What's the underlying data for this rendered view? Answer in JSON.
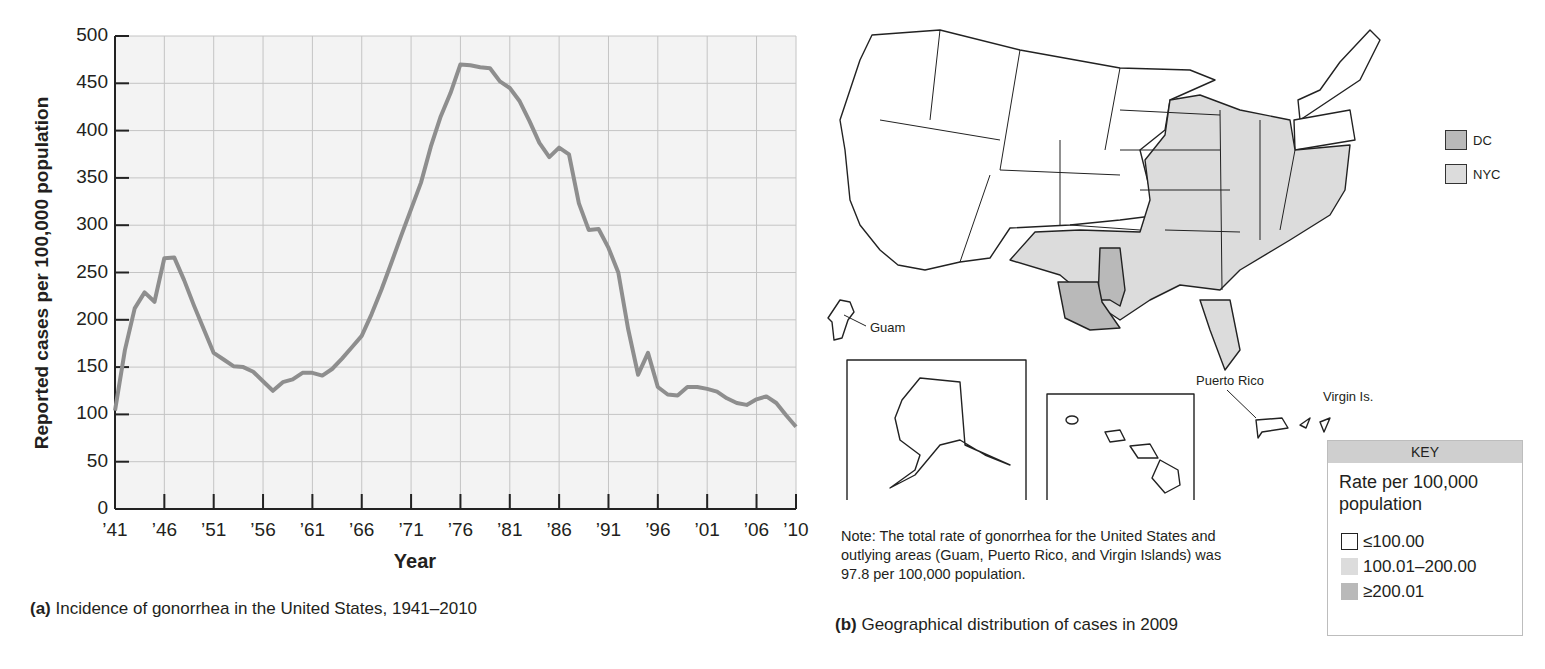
{
  "panel_a": {
    "ylabel": "Reported cases per 100,000 population",
    "xlabel": "Year",
    "caption_label": "(a)",
    "caption_text": " Incidence of gonorrhea in the United States, 1941–2010",
    "yticks": [
      "500",
      "450",
      "400",
      "350",
      "300",
      "250",
      "200",
      "150",
      "100",
      "50",
      "0"
    ],
    "xticks": [
      "’41",
      "’46",
      "’51",
      "’56",
      "’61",
      "’66",
      "’71",
      "’76",
      "’81",
      "’86",
      "’91",
      "’96",
      "’01",
      "’06",
      "’10"
    ]
  },
  "panel_b": {
    "caption_label": "(b)",
    "caption_text": " Geographical distribution of cases in 2009",
    "note": "Note: The total rate of gonorrhea for the United States and outlying areas (Guam, Puerto Rico, and Virgin Islands) was 97.8 per 100,000 population.",
    "labels": {
      "guam": "Guam",
      "puerto_rico": "Puerto Rico",
      "virgin_islands": "Virgin Is."
    },
    "inset_legend": [
      {
        "label": "DC",
        "color": "#b9b9b9"
      },
      {
        "label": "NYC",
        "color": "#dcdcdc"
      }
    ],
    "key": {
      "header": "KEY",
      "title": "Rate per 100,000 population",
      "items": [
        {
          "label": "≤100.00",
          "color": "#ffffff"
        },
        {
          "label": "100.01–200.00",
          "color": "#dcdcdc"
        },
        {
          "label": "≥200.01",
          "color": "#b9b9b9"
        }
      ]
    }
  },
  "colors": {
    "line": "#8e8e8e",
    "grid": "#c4c4c4",
    "plot_bg": "#f3f3f3",
    "state_fill_mid": "#dcdcdc",
    "state_fill_high": "#b9b9b9"
  },
  "chart_data": [
    {
      "type": "line",
      "title": "Incidence of gonorrhea in the United States, 1941–2010",
      "xlabel": "Year",
      "ylabel": "Reported cases per 100,000 population",
      "ylim": [
        0,
        500
      ],
      "xlim": [
        1941,
        2010
      ],
      "grid": true,
      "x": [
        1941,
        1942,
        1943,
        1944,
        1945,
        1946,
        1947,
        1948,
        1949,
        1950,
        1951,
        1952,
        1953,
        1954,
        1955,
        1956,
        1957,
        1958,
        1959,
        1960,
        1961,
        1962,
        1963,
        1964,
        1965,
        1966,
        1967,
        1968,
        1969,
        1970,
        1971,
        1972,
        1973,
        1974,
        1975,
        1976,
        1977,
        1978,
        1979,
        1980,
        1981,
        1982,
        1983,
        1984,
        1985,
        1986,
        1987,
        1988,
        1989,
        1990,
        1991,
        1992,
        1993,
        1994,
        1995,
        1996,
        1997,
        1998,
        1999,
        2000,
        2001,
        2002,
        2003,
        2004,
        2005,
        2006,
        2007,
        2008,
        2009,
        2010
      ],
      "series": [
        {
          "name": "Gonorrhea rate",
          "values": [
            104,
            168,
            212,
            229,
            219,
            265,
            266,
            242,
            215,
            190,
            165,
            158,
            151,
            150,
            145,
            135,
            125,
            134,
            137,
            144,
            144,
            141,
            148,
            159,
            171,
            183,
            206,
            232,
            260,
            289,
            317,
            345,
            383,
            415,
            440,
            470,
            469,
            467,
            466,
            452,
            445,
            431,
            410,
            387,
            372,
            382,
            375,
            323,
            295,
            296,
            276,
            250,
            190,
            142,
            165,
            129,
            121,
            120,
            129,
            129,
            127,
            124,
            117,
            112,
            110,
            116,
            119,
            112,
            99,
            87
          ]
        }
      ]
    },
    {
      "type": "map",
      "title": "Geographical distribution of cases in 2009",
      "legend": [
        "≤100.00",
        "100.01–200.00",
        "≥200.01"
      ],
      "legend_title": "Rate per 100,000 population"
    }
  ]
}
